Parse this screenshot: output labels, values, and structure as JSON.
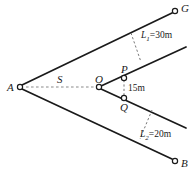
{
  "figure": {
    "type": "geometry-diagram",
    "width": 196,
    "height": 173,
    "background_color": "#ffffff",
    "line_color": "#1a1a1a",
    "dash_color": "#8a8a8a"
  },
  "points": {
    "A": {
      "label": "A",
      "x": 20,
      "y": 86
    },
    "G": {
      "label": "G",
      "x": 176,
      "y": 11
    },
    "B": {
      "label": "B",
      "x": 176,
      "y": 161
    },
    "O": {
      "label": "O",
      "x": 99,
      "y": 87
    },
    "P": {
      "label": "P",
      "x": 124,
      "y": 77
    },
    "Q": {
      "label": "Q",
      "x": 124,
      "y": 99
    }
  },
  "labels": {
    "A": "A",
    "G": "G",
    "B": "B",
    "O": "O",
    "P": "P",
    "Q": "Q",
    "S": "S"
  },
  "dimensions": {
    "L1": {
      "symbol": "L",
      "subscript": "1",
      "equals": "=",
      "value": "30m",
      "full": "L₁=30m"
    },
    "L2": {
      "symbol": "L",
      "subscript": "2",
      "equals": "=",
      "value": "20m",
      "full": "L₂=20m"
    },
    "PQ": {
      "value": "15m",
      "full": "15m"
    },
    "S": {
      "symbol": "S",
      "full": "S"
    }
  },
  "segments": [
    {
      "name": "ray-A-G",
      "from": "A",
      "to": "G",
      "style": "solid"
    },
    {
      "name": "ray-A-B",
      "from": "A",
      "to": "B",
      "style": "solid"
    },
    {
      "name": "ray-O-P-upper",
      "from": "O",
      "to": "upper-right-end",
      "style": "solid"
    },
    {
      "name": "ray-O-Q-lower",
      "from": "O",
      "to": "lower-right-end",
      "style": "solid"
    },
    {
      "name": "baseline-A-O",
      "from": "A",
      "to": "O",
      "style": "dashed",
      "label": "S"
    },
    {
      "name": "measure-L1",
      "style": "dashed",
      "label": "L₁=30m"
    },
    {
      "name": "measure-L2",
      "style": "dashed",
      "label": "L₂=20m"
    },
    {
      "name": "measure-PQ",
      "from": "P",
      "to": "Q",
      "style": "dashed",
      "label": "15m"
    }
  ]
}
